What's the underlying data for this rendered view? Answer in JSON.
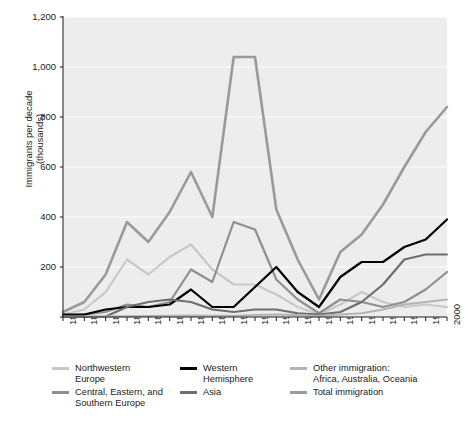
{
  "chart_data": {
    "type": "line",
    "title": "",
    "xlabel": "",
    "ylabel": "Immigrants per decade\n(thousands)",
    "ylim": [
      0,
      1200
    ],
    "yticks": [
      0,
      200,
      400,
      600,
      800,
      1000,
      1200
    ],
    "ytick_labels": [
      "",
      "200",
      "400",
      "600",
      "800",
      "1,000",
      "1,200"
    ],
    "grid": "horizontal",
    "legend_position": "bottom",
    "x": [
      1820,
      1830,
      1840,
      1850,
      1860,
      1870,
      1880,
      1890,
      1900,
      1910,
      1920,
      1930,
      1940,
      1950,
      1960,
      1970,
      1980,
      1990,
      2000
    ],
    "xtick_labels": [
      "1820",
      "1830",
      "1840",
      "1850",
      "1860",
      "1870",
      "1880",
      "1890",
      "1900",
      "1910",
      "1920",
      "1930",
      "1940",
      "1950",
      "1960",
      "1970",
      "1980",
      "1990",
      "2000"
    ],
    "series": [
      {
        "name": "Northwestern Europe",
        "color": "#c8c8c8",
        "width": 2.2,
        "values": [
          10,
          30,
          100,
          230,
          170,
          240,
          290,
          190,
          130,
          130,
          90,
          40,
          10,
          50,
          100,
          60,
          40,
          50,
          40
        ]
      },
      {
        "name": "Central, Eastern, and Southern Europe",
        "color": "#8f8f8f",
        "width": 2.2,
        "values": [
          5,
          10,
          20,
          50,
          40,
          60,
          190,
          140,
          380,
          350,
          150,
          70,
          15,
          70,
          60,
          40,
          60,
          110,
          180
        ]
      },
      {
        "name": "Western Hemisphere",
        "color": "#000000",
        "width": 2.2,
        "values": [
          10,
          10,
          30,
          40,
          40,
          50,
          110,
          40,
          40,
          120,
          200,
          100,
          40,
          160,
          220,
          220,
          280,
          310,
          390
        ]
      },
      {
        "name": "Asia",
        "color": "#6e6e6e",
        "width": 2.2,
        "values": [
          1,
          1,
          2,
          40,
          60,
          70,
          60,
          30,
          20,
          30,
          30,
          15,
          10,
          20,
          60,
          130,
          230,
          250,
          250
        ]
      },
      {
        "name": "Other immigration: Africa, Australia, Oceania",
        "color": "#b4b4b4",
        "width": 2.2,
        "values": [
          1,
          1,
          2,
          3,
          4,
          5,
          6,
          5,
          5,
          8,
          10,
          8,
          4,
          10,
          15,
          30,
          50,
          60,
          70
        ]
      },
      {
        "name": "Total immigration",
        "color": "#9a9a9a",
        "width": 2.6,
        "values": [
          20,
          60,
          170,
          380,
          300,
          420,
          580,
          400,
          1040,
          1040,
          430,
          230,
          70,
          260,
          330,
          450,
          600,
          740,
          840
        ]
      }
    ]
  },
  "legend": {
    "items": [
      {
        "label": "Northwestern\nEurope",
        "color": "#c8c8c8"
      },
      {
        "label": "Central, Eastern, and\nSouthern Europe",
        "color": "#8f8f8f"
      },
      {
        "label": "Western\nHemisphere",
        "color": "#000000"
      },
      {
        "label": "Asia",
        "color": "#6e6e6e"
      },
      {
        "label": "Other immigration:\nAfrica, Australia, Oceania",
        "color": "#b4b4b4"
      },
      {
        "label": "Total immigration",
        "color": "#9a9a9a"
      }
    ]
  },
  "plot_style": {
    "background": "#ededed",
    "gridline_color": "#ffffff",
    "axis_color": "#1a1a1a"
  }
}
